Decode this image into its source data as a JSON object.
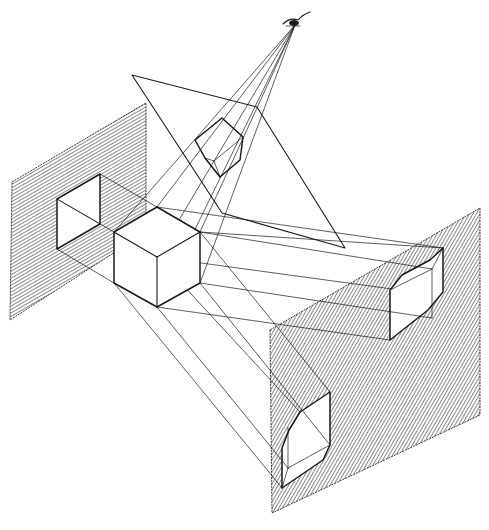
{
  "diagram": {
    "title": "",
    "description": "Projection of a cube onto three planes of projection (left vertical plane, inclined upper plane viewed from an eye point, right vertical plane) with projector lines",
    "colors": {
      "ink": "#1a1a1a",
      "background": "#ffffff",
      "hatch": "#2a2a2a"
    },
    "elements": {
      "eye": {
        "label": "eye-observer",
        "x": 295,
        "y": 22
      },
      "object": {
        "label": "cube",
        "shape": "hexagon-isometric"
      },
      "planes": [
        {
          "id": "left-plane",
          "orientation": "vertical",
          "hatched": true
        },
        {
          "id": "inclined-plane",
          "orientation": "inclined",
          "hatched": true
        },
        {
          "id": "right-plane",
          "orientation": "vertical",
          "hatched": true
        }
      ],
      "projections": [
        {
          "id": "left-projection",
          "shape": "parallelogram"
        },
        {
          "id": "inclined-projection",
          "shape": "pentagon-view"
        },
        {
          "id": "right-upper-projection",
          "shape": "chamfered-box"
        },
        {
          "id": "right-lower-projection",
          "shape": "chamfered-box"
        }
      ],
      "projector_lines": "thin convergent/parallel lines"
    }
  }
}
